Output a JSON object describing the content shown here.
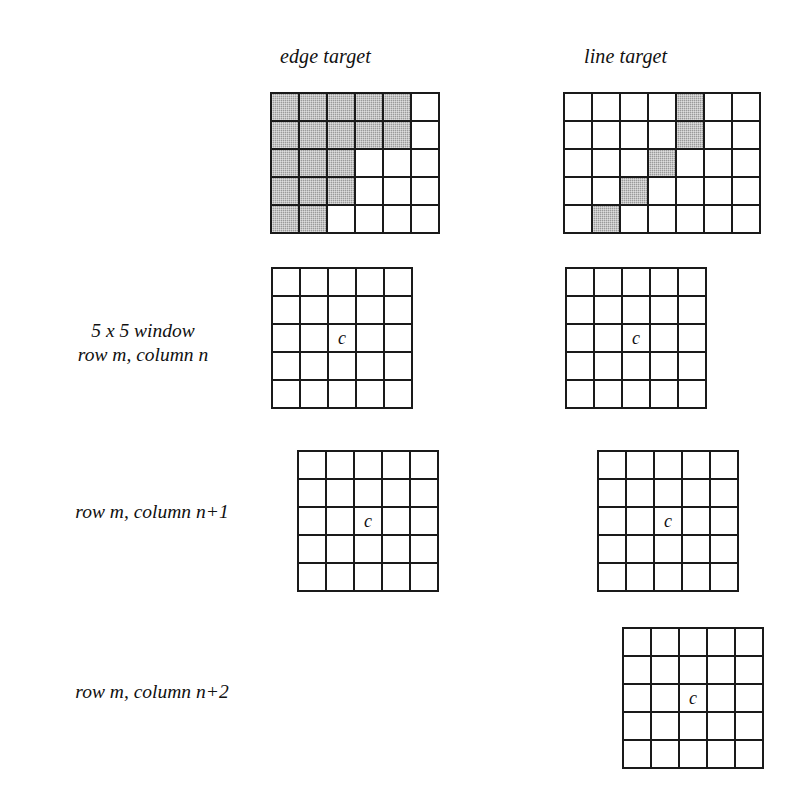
{
  "figure": {
    "caption_headings": {
      "edge": "edge target",
      "line": "line target"
    },
    "row_labels": {
      "window": "5 x 5 window",
      "window_sub": "row m, column n",
      "n_plus_1": "row m, column n+1",
      "n_plus_2": "row m, column n+2"
    },
    "center_marker": "c",
    "colors": {
      "shaded_cell": "#9a9a9a",
      "grid_line": "#1a1a1a",
      "background": "#ffffff",
      "text": "#111111"
    }
  },
  "grids": {
    "edge_target": {
      "name": "edge target",
      "cols": 6,
      "rows": 5,
      "shaded_cells": [
        [
          1,
          1
        ],
        [
          1,
          2
        ],
        [
          1,
          3
        ],
        [
          1,
          4
        ],
        [
          1,
          5
        ],
        [
          2,
          1
        ],
        [
          2,
          2
        ],
        [
          2,
          3
        ],
        [
          2,
          4
        ],
        [
          2,
          5
        ],
        [
          3,
          1
        ],
        [
          3,
          2
        ],
        [
          3,
          3
        ],
        [
          4,
          1
        ],
        [
          4,
          2
        ],
        [
          4,
          3
        ],
        [
          5,
          1
        ],
        [
          5,
          2
        ]
      ],
      "marks": []
    },
    "line_target": {
      "name": "line target",
      "cols": 7,
      "rows": 5,
      "shaded_cells": [
        [
          1,
          5
        ],
        [
          2,
          5
        ],
        [
          3,
          4
        ],
        [
          4,
          3
        ],
        [
          5,
          2
        ]
      ],
      "marks": []
    },
    "edge_window_n": {
      "name": "edge target 5x5 window at row m, column n",
      "cols": 5,
      "rows": 5,
      "shaded_cells": [],
      "marks": [
        {
          "row": 3,
          "col": 3,
          "text": "c"
        }
      ]
    },
    "line_window_n": {
      "name": "line target 5x5 window at row m, column n",
      "cols": 5,
      "rows": 5,
      "shaded_cells": [],
      "marks": [
        {
          "row": 3,
          "col": 3,
          "text": "c"
        }
      ]
    },
    "edge_window_n1": {
      "name": "edge target 5x5 window at row m, column n+1",
      "cols": 5,
      "rows": 5,
      "shaded_cells": [],
      "marks": [
        {
          "row": 3,
          "col": 3,
          "text": "c"
        }
      ]
    },
    "line_window_n1": {
      "name": "line target 5x5 window at row m, column n+1",
      "cols": 5,
      "rows": 5,
      "shaded_cells": [],
      "marks": [
        {
          "row": 3,
          "col": 3,
          "text": "c"
        }
      ]
    },
    "line_window_n2": {
      "name": "line target 5x5 window at row m, column n+2",
      "cols": 5,
      "rows": 5,
      "shaded_cells": [],
      "marks": [
        {
          "row": 3,
          "col": 3,
          "text": "c"
        }
      ]
    }
  }
}
